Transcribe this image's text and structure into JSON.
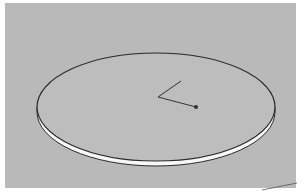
{
  "viewport": {
    "background": "#b9b9b9",
    "border": "#ffffff"
  },
  "model": {
    "shape": "disc",
    "top_face_color": "#bdbdbd",
    "side_color": "#f7f7f7",
    "edge_color": "#2a2a2a"
  },
  "tool": {
    "name": "rotate-protractor",
    "line_color": "#333333",
    "point_color": "#333333"
  }
}
